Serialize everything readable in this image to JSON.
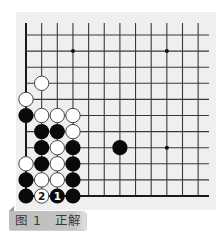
{
  "diagram": {
    "type": "go-board-partial",
    "caption": {
      "figure": "图 1",
      "title": "正解",
      "full": "图 1　正解"
    },
    "grid": {
      "columns": 12,
      "rows": 11,
      "origin_x": 26,
      "origin_y": 35,
      "col_spacing": 15.65,
      "row_spacing": 16.1,
      "line_top_y": 23,
      "line_right_x": 209,
      "edges": [
        "left",
        "bottom"
      ]
    },
    "star_points": [
      {
        "col": 3,
        "row": 1
      },
      {
        "col": 9,
        "row": 1
      },
      {
        "col": 9,
        "row": 7
      }
    ],
    "stones": [
      {
        "col": 1,
        "row": 3,
        "color": "white"
      },
      {
        "col": 0,
        "row": 4,
        "color": "white"
      },
      {
        "col": 0,
        "row": 5,
        "color": "black"
      },
      {
        "col": 1,
        "row": 5,
        "color": "white"
      },
      {
        "col": 2,
        "row": 5,
        "color": "white"
      },
      {
        "col": 3,
        "row": 5,
        "color": "white"
      },
      {
        "col": 1,
        "row": 6,
        "color": "black"
      },
      {
        "col": 2,
        "row": 6,
        "color": "black"
      },
      {
        "col": 3,
        "row": 6,
        "color": "white"
      },
      {
        "col": 1,
        "row": 7,
        "color": "black"
      },
      {
        "col": 2,
        "row": 7,
        "color": "white"
      },
      {
        "col": 3,
        "row": 7,
        "color": "black"
      },
      {
        "col": 6,
        "row": 7,
        "color": "black"
      },
      {
        "col": 0,
        "row": 8,
        "color": "white"
      },
      {
        "col": 1,
        "row": 8,
        "color": "black"
      },
      {
        "col": 2,
        "row": 8,
        "color": "white"
      },
      {
        "col": 3,
        "row": 8,
        "color": "black"
      },
      {
        "col": 0,
        "row": 9,
        "color": "black"
      },
      {
        "col": 1,
        "row": 9,
        "color": "white"
      },
      {
        "col": 2,
        "row": 9,
        "color": "white"
      },
      {
        "col": 3,
        "row": 9,
        "color": "black"
      },
      {
        "col": 0,
        "row": 10,
        "color": "black"
      },
      {
        "col": 1,
        "row": 10,
        "color": "white",
        "label": "2"
      },
      {
        "col": 2,
        "row": 10,
        "color": "black",
        "label": "1"
      },
      {
        "col": 3,
        "row": 10,
        "color": "black"
      }
    ],
    "colors": {
      "board_background": "#efefef",
      "grid_line": "#3a3a3a",
      "edge_line": "#1a1a1a",
      "black_stone": "#0a0a0a",
      "white_stone": "#ffffff",
      "white_stone_border": "#333333",
      "label_bg": "#c2c2c2",
      "label_text": "#3a3a3a"
    }
  }
}
